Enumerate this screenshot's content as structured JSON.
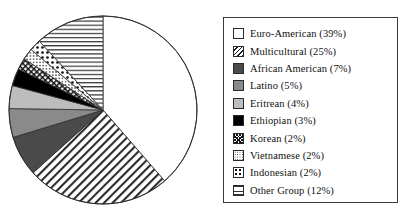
{
  "chart_data": {
    "type": "pie",
    "title": "",
    "labels": [
      "Euro-American",
      "Multicultural",
      "African American",
      "Latino",
      "Eritrean",
      "Ethiopian",
      "Korean",
      "Vietnamese",
      "Indonesian",
      "Other Group"
    ],
    "values": [
      39,
      25,
      7,
      5,
      4,
      3,
      2,
      2,
      2,
      12
    ],
    "value_unit": "%",
    "legend_position": "right",
    "start_angle_deg": 0,
    "direction": "clockwise",
    "slices": [
      {
        "label": "Euro-American",
        "value": 39,
        "pattern": "empty",
        "fill": "#ffffff"
      },
      {
        "label": "Multicultural",
        "value": 25,
        "pattern": "diagonal",
        "fill": "#ffffff"
      },
      {
        "label": "African American",
        "value": 7,
        "pattern": "solid",
        "fill": "#4a4a4a"
      },
      {
        "label": "Latino",
        "value": 5,
        "pattern": "solid",
        "fill": "#8a8a8a"
      },
      {
        "label": "Eritrean",
        "value": 4,
        "pattern": "solid",
        "fill": "#bdbdbd"
      },
      {
        "label": "Ethiopian",
        "value": 3,
        "pattern": "solid",
        "fill": "#000000"
      },
      {
        "label": "Korean",
        "value": 2,
        "pattern": "crosshatch",
        "fill": "#ffffff"
      },
      {
        "label": "Vietnamese",
        "value": 2,
        "pattern": "fine-dots",
        "fill": "#ffffff"
      },
      {
        "label": "Indonesian",
        "value": 2,
        "pattern": "large-dots",
        "fill": "#ffffff"
      },
      {
        "label": "Other Group",
        "value": 12,
        "pattern": "horizontal",
        "fill": "#ffffff"
      }
    ]
  },
  "legend": {
    "entries": [
      {
        "label": "Euro-American (39%)",
        "swatch": "sw-empty"
      },
      {
        "label": "Multicultural (25%)",
        "swatch": "sw-diag"
      },
      {
        "label": "African American (7%)",
        "swatch": "sw-darkgray"
      },
      {
        "label": "Latino (5%)",
        "swatch": "sw-medgray"
      },
      {
        "label": "Eritrean (4%)",
        "swatch": "sw-ltgray"
      },
      {
        "label": "Ethiopian (3%)",
        "swatch": "sw-black"
      },
      {
        "label": "Korean (2%)",
        "swatch": "sw-cross"
      },
      {
        "label": "Vietnamese (2%)",
        "swatch": "sw-finedot"
      },
      {
        "label": "Indonesian (2%)",
        "swatch": "sw-bigdot"
      },
      {
        "label": "Other Group (12%)",
        "swatch": "sw-hline"
      }
    ]
  }
}
